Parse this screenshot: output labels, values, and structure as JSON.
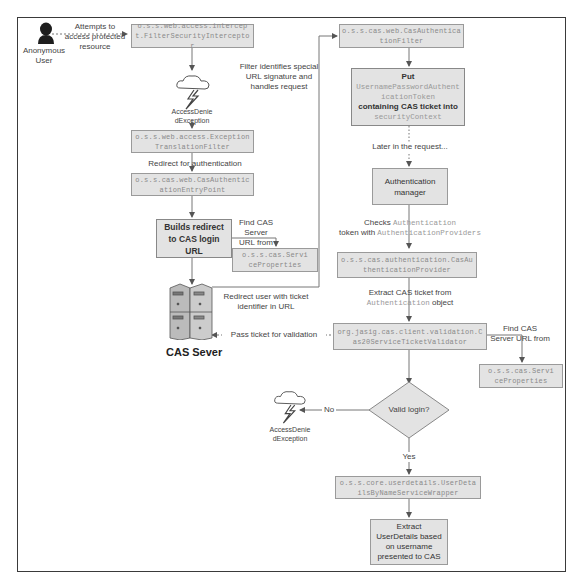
{
  "diagram": {
    "actor": {
      "label": "Anonymous User"
    },
    "cas_server": {
      "label": "CAS Sever"
    },
    "nodes": {
      "filter_security_interceptor": "o.s.s.web.access.intercept.FilterSecurityInterceptor",
      "exception_translation_filter": "o.s.s.web.access.ExceptionTranslationFilter",
      "cas_auth_entry_point": "o.s.s.cas.web.CasAuthenticationEntryPoint",
      "builds_redirect": "Builds redirect to CAS login URL",
      "service_properties_left": "o.s.s.cas.ServiceProperties",
      "cas_authentication_filter": "o.s.s.cas.web.CasAuthenticationFilter",
      "put_token_parts": {
        "p1": "Put",
        "p2": "UsernamePasswordAuthenticationToken",
        "p3": "containing CAS ticket into",
        "p4": "securityContext"
      },
      "authentication_manager": "Authentication manager",
      "cas_auth_provider": "o.s.s.cas.authentication.CasAuthenticationProvider",
      "cas20_validator": "org.jasig.cas.client.validation.Cas20ServiceTicketValidator",
      "service_properties_right": "o.s.s.cas.ServiceProperties",
      "valid_login": "Valid login?",
      "user_details_wrapper": "o.s.s.core.userdetails.UserDetailsByNameServiceWrapper",
      "extract_user_details": "Extract UserDetails based on username presented to CAS"
    },
    "exceptions": {
      "top": "AccessDeniedException",
      "bottom": "AccessDeniedException"
    },
    "labels": {
      "attempts": "Attempts to access protected resource",
      "filter_identifies": "Filter identifies special URL signature and handles request",
      "redirect_for_auth": "Redirect for authentication",
      "find_cas_left": "Find CAS Server URL from",
      "redirect_user": "Redirect user with ticket identifier in URL",
      "pass_ticket": "Pass ticket for validation",
      "later_in_request": "Later in the request...",
      "checks_1": "Checks",
      "checks_mono1": "Authentication",
      "checks_2": "token with",
      "checks_mono2": "AuthenticationProviders",
      "extract_1": "Extract CAS ticket from",
      "extract_mono": "Authentication",
      "extract_2": "object",
      "find_cas_right": "Find CAS Server URL from",
      "no": "No",
      "yes": "Yes"
    }
  }
}
